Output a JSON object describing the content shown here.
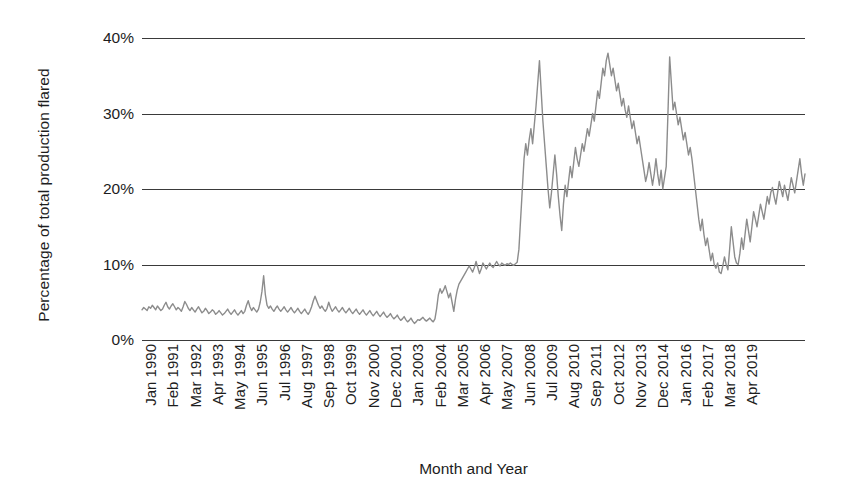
{
  "chart_data": {
    "type": "line",
    "title": "",
    "xlabel": "Month and Year",
    "ylabel": "Percentage of total production flared",
    "ylim": [
      0,
      40
    ],
    "y_ticks": [
      0,
      10,
      20,
      30,
      40
    ],
    "y_tick_labels": [
      "0%",
      "10%",
      "20%",
      "30%",
      "40%"
    ],
    "grid": true,
    "legend": "none",
    "line_color": "#8c8c8c",
    "x_tick_labels": [
      "Jan 1990",
      "Feb 1991",
      "Mar 1992",
      "Apr 1993",
      "May 1994",
      "Jun 1995",
      "Jul 1996",
      "Aug 1997",
      "Sep 1998",
      "Oct 1999",
      "Nov 2000",
      "Dec 2001",
      "Jan 2003",
      "Feb 2004",
      "Mar 2005",
      "Apr 2006",
      "May 2007",
      "Jun 2008",
      "Jul 2009",
      "Aug 2010",
      "Sep 2011",
      "Oct 2012",
      "Nov 2013",
      "Dec 2014",
      "Jan 2016",
      "Feb 2017",
      "Mar 2018",
      "Apr 2019"
    ],
    "x_tick_positions_months": [
      0,
      13,
      26,
      39,
      52,
      65,
      78,
      91,
      104,
      117,
      130,
      143,
      156,
      169,
      182,
      195,
      208,
      221,
      234,
      247,
      260,
      273,
      286,
      299,
      312,
      325,
      338,
      351
    ],
    "x_start": "Jan 1990",
    "x_end": "Apr 2019",
    "n_points": 352,
    "units": "percent",
    "values": [
      4.0,
      4.3,
      4.1,
      3.9,
      4.4,
      4.2,
      4.6,
      4.3,
      4.0,
      4.5,
      4.2,
      3.9,
      4.1,
      4.6,
      5.0,
      4.4,
      4.1,
      4.5,
      4.8,
      4.4,
      4.0,
      4.3,
      4.1,
      3.8,
      4.4,
      5.1,
      4.7,
      4.2,
      3.9,
      4.3,
      4.0,
      3.7,
      4.1,
      4.4,
      4.0,
      3.6,
      3.8,
      4.2,
      3.9,
      3.5,
      3.7,
      4.0,
      3.8,
      3.4,
      3.6,
      3.9,
      3.6,
      3.3,
      3.5,
      3.8,
      4.1,
      3.7,
      3.4,
      3.7,
      4.0,
      3.6,
      3.3,
      3.6,
      3.9,
      3.5,
      3.8,
      4.6,
      5.2,
      4.4,
      3.9,
      4.3,
      4.0,
      3.7,
      4.1,
      5.0,
      6.4,
      8.5,
      6.0,
      4.6,
      4.2,
      4.5,
      4.1,
      3.8,
      4.2,
      4.5,
      4.1,
      3.8,
      4.1,
      4.4,
      4.0,
      3.7,
      4.0,
      4.3,
      3.9,
      3.6,
      3.9,
      4.2,
      3.8,
      3.5,
      3.8,
      4.1,
      3.7,
      3.4,
      3.8,
      4.4,
      5.2,
      5.8,
      5.2,
      4.6,
      4.2,
      4.5,
      4.1,
      3.8,
      4.2,
      5.0,
      4.3,
      3.8,
      4.1,
      4.4,
      4.0,
      3.7,
      4.0,
      4.3,
      3.9,
      3.6,
      3.9,
      4.2,
      3.8,
      3.5,
      3.8,
      4.1,
      3.7,
      3.4,
      3.7,
      4.0,
      3.6,
      3.3,
      3.6,
      3.9,
      3.5,
      3.2,
      3.5,
      3.8,
      3.4,
      3.1,
      3.4,
      3.7,
      3.3,
      3.0,
      3.2,
      3.5,
      3.1,
      2.8,
      3.0,
      3.3,
      2.9,
      2.6,
      2.8,
      3.1,
      2.7,
      2.4,
      2.6,
      2.9,
      2.5,
      2.2,
      2.4,
      2.7,
      2.6,
      2.8,
      3.0,
      2.7,
      2.5,
      2.7,
      2.9,
      2.6,
      2.4,
      2.8,
      4.2,
      6.0,
      6.8,
      6.2,
      6.6,
      7.2,
      6.4,
      5.6,
      6.2,
      5.0,
      3.8,
      5.4,
      6.6,
      7.4,
      7.8,
      8.2,
      8.6,
      9.0,
      9.4,
      9.8,
      9.4,
      9.0,
      9.6,
      10.4,
      9.6,
      8.8,
      9.4,
      10.2,
      9.8,
      9.4,
      9.8,
      10.2,
      9.8,
      9.6,
      10.0,
      10.4,
      10.0,
      9.8,
      10.2,
      10.0,
      9.9,
      10.1,
      10.0,
      10.2,
      10.0,
      9.9,
      10.1,
      10.3,
      12.0,
      16.0,
      20.0,
      24.0,
      26.0,
      24.5,
      26.5,
      28.0,
      26.0,
      28.5,
      31.0,
      34.0,
      37.0,
      33.0,
      29.0,
      26.0,
      23.0,
      20.0,
      17.5,
      19.5,
      22.0,
      24.5,
      22.0,
      19.0,
      16.5,
      14.5,
      18.0,
      20.5,
      19.0,
      21.0,
      23.0,
      21.5,
      23.5,
      25.5,
      24.0,
      23.0,
      24.5,
      26.0,
      25.0,
      26.5,
      28.0,
      27.0,
      28.5,
      30.0,
      29.0,
      31.0,
      33.0,
      32.0,
      34.0,
      36.0,
      35.0,
      37.0,
      38.0,
      36.5,
      35.0,
      36.0,
      34.5,
      33.0,
      34.0,
      32.5,
      31.0,
      32.0,
      30.5,
      29.5,
      31.0,
      29.5,
      28.0,
      29.0,
      27.5,
      26.0,
      27.0,
      25.5,
      24.0,
      22.5,
      21.0,
      22.0,
      23.5,
      22.0,
      20.5,
      22.0,
      24.0,
      22.0,
      20.5,
      22.5,
      20.0,
      21.5,
      23.0,
      30.0,
      37.5,
      34.0,
      30.5,
      31.5,
      30.0,
      28.5,
      29.5,
      28.0,
      26.5,
      27.5,
      26.0,
      24.5,
      25.5,
      24.0,
      22.0,
      20.0,
      18.0,
      16.0,
      14.5,
      16.0,
      14.0,
      12.5,
      13.5,
      12.0,
      10.5,
      11.5,
      10.0,
      9.5,
      10.2,
      9.0,
      8.8,
      9.8,
      11.0,
      10.0,
      9.3,
      12.0,
      15.0,
      13.0,
      11.0,
      10.2,
      10.0,
      11.5,
      13.5,
      12.0,
      14.0,
      16.0,
      14.5,
      13.0,
      15.0,
      17.0,
      16.0,
      15.0,
      16.5,
      18.0,
      17.0,
      16.0,
      17.5,
      19.0,
      18.0,
      19.5,
      20.2,
      19.0,
      18.0,
      19.5,
      21.0,
      20.0,
      19.0,
      20.5,
      19.5,
      18.5,
      20.0,
      21.5,
      20.5,
      19.5,
      21.0,
      22.5,
      24.0,
      22.0,
      20.5,
      22.0
    ]
  }
}
